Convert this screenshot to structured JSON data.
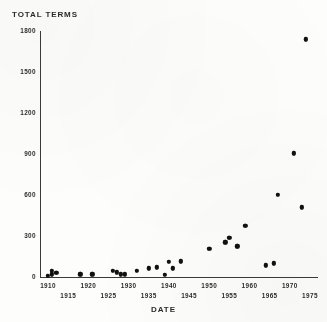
{
  "chart_data": {
    "type": "scatter",
    "title": "",
    "xlabel": "DATE",
    "ylabel": "TOTAL TERMS",
    "xlim": [
      1908,
      1977
    ],
    "ylim": [
      0,
      1800
    ],
    "grid": false,
    "legend": null,
    "xticks": [
      1910,
      1915,
      1920,
      1925,
      1930,
      1935,
      1940,
      1945,
      1950,
      1955,
      1960,
      1965,
      1970,
      1975
    ],
    "yticks": [
      0,
      300,
      600,
      900,
      1200,
      1500,
      1800
    ],
    "ytick_labels": [
      "0",
      "300",
      "600",
      "900",
      "1200",
      "1500",
      "1800"
    ],
    "xtick_labels": [
      "1910",
      "1915",
      "1920",
      "1925",
      "1930",
      "1935",
      "1940",
      "1945",
      "1950",
      "1955",
      "1960",
      "1965",
      "1970",
      "1975"
    ],
    "marker": "filled-circle",
    "marker_color": "#111111",
    "axis_color": "#3a3a3a",
    "background_color": "#fdfdfc",
    "x": [
      1910,
      1911,
      1911,
      1912,
      1918,
      1921,
      1926,
      1927,
      1928,
      1929,
      1932,
      1935,
      1937,
      1939,
      1940,
      1941,
      1943,
      1950,
      1954,
      1955,
      1957,
      1959,
      1964,
      1966,
      1967,
      1971,
      1973,
      1974
    ],
    "y": [
      10,
      20,
      45,
      30,
      20,
      20,
      45,
      35,
      20,
      20,
      45,
      65,
      70,
      15,
      110,
      65,
      115,
      205,
      255,
      285,
      225,
      375,
      85,
      100,
      600,
      905,
      510,
      1740
    ],
    "points": [
      {
        "x": 1910,
        "y": 10
      },
      {
        "x": 1911,
        "y": 20
      },
      {
        "x": 1911,
        "y": 45
      },
      {
        "x": 1912,
        "y": 30
      },
      {
        "x": 1918,
        "y": 20
      },
      {
        "x": 1921,
        "y": 20
      },
      {
        "x": 1926,
        "y": 45
      },
      {
        "x": 1927,
        "y": 35
      },
      {
        "x": 1928,
        "y": 20
      },
      {
        "x": 1929,
        "y": 20
      },
      {
        "x": 1932,
        "y": 45
      },
      {
        "x": 1935,
        "y": 65
      },
      {
        "x": 1937,
        "y": 70
      },
      {
        "x": 1939,
        "y": 15
      },
      {
        "x": 1940,
        "y": 110
      },
      {
        "x": 1941,
        "y": 65
      },
      {
        "x": 1943,
        "y": 115
      },
      {
        "x": 1950,
        "y": 205
      },
      {
        "x": 1954,
        "y": 255
      },
      {
        "x": 1955,
        "y": 285
      },
      {
        "x": 1957,
        "y": 225
      },
      {
        "x": 1959,
        "y": 375
      },
      {
        "x": 1964,
        "y": 85
      },
      {
        "x": 1966,
        "y": 100
      },
      {
        "x": 1967,
        "y": 600
      },
      {
        "x": 1971,
        "y": 905
      },
      {
        "x": 1973,
        "y": 510
      },
      {
        "x": 1974,
        "y": 1740
      }
    ]
  }
}
